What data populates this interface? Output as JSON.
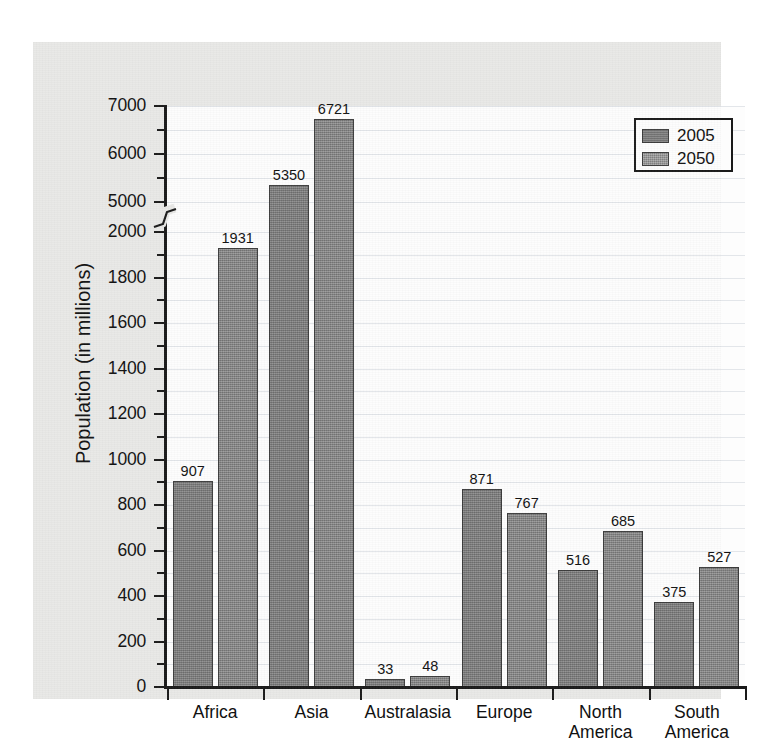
{
  "chart_data": {
    "type": "bar",
    "title": "",
    "xlabel": "",
    "ylabel": "Population (in millions)",
    "categories": [
      "Africa",
      "Asia",
      "Australasia",
      "Europe",
      "North\nAmerica",
      "South\nAmerica"
    ],
    "category_labels": [
      {
        "line1": "Africa",
        "line2": ""
      },
      {
        "line1": "Asia",
        "line2": ""
      },
      {
        "line1": "Australasia",
        "line2": ""
      },
      {
        "line1": "Europe",
        "line2": ""
      },
      {
        "line1": "North",
        "line2": "America"
      },
      {
        "line1": "South",
        "line2": "America"
      }
    ],
    "series": [
      {
        "name": "2005",
        "values": [
          907,
          5350,
          33,
          871,
          516,
          375
        ],
        "color": "#7b7b7b"
      },
      {
        "name": "2050",
        "values": [
          1931,
          6721,
          48,
          767,
          685,
          527
        ],
        "color": "#7f7f7f"
      }
    ],
    "axis_break": true,
    "axis_break_between": [
      2000,
      5000
    ],
    "ylim_lower": [
      0,
      2000
    ],
    "ylim_upper": [
      5000,
      7000
    ],
    "ytick_labels": [
      "0",
      "200",
      "400",
      "600",
      "800",
      "1000",
      "1200",
      "1400",
      "1600",
      "1800",
      "2000",
      "5000",
      "6000",
      "7000"
    ],
    "ytick_values": [
      0,
      200,
      400,
      600,
      800,
      1000,
      1200,
      1400,
      1600,
      1800,
      2000,
      5000,
      6000,
      7000
    ],
    "yminor_values": [
      100,
      300,
      500,
      700,
      900,
      1100,
      1300,
      1500,
      1700,
      1900,
      5500,
      6500
    ],
    "grid": true,
    "grid_color": "#e3e6ea",
    "legend": {
      "position": "top-right",
      "entries": [
        {
          "label": "2005",
          "swatch": "series-2005-swatch"
        },
        {
          "label": "2050",
          "swatch": "series-2050-swatch"
        }
      ]
    },
    "panel_background": "#e9e9e7",
    "plot_background": "#fdfdfd",
    "axis_color": "#1a1a1a",
    "bar_outline_color": "#3c3c3c"
  }
}
